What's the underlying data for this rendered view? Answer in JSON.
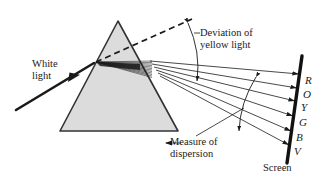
{
  "figure": {
    "name": "prism-dispersion-diagram",
    "type": "physics-optics-ray-diagram",
    "background_color": "#ffffff",
    "ink_color": "#1a1a1a",
    "prism_fill": "#dcdcdc"
  },
  "labels": {
    "white_light": "White\nlight",
    "deviation": "Deviation of\nyellow light",
    "dispersion": "Measure of\ndispersion",
    "screen": "Screen"
  },
  "spectrum": {
    "letters": [
      {
        "symbol": "R",
        "name": "red",
        "x": 305,
        "y": 74
      },
      {
        "symbol": "O",
        "name": "orange",
        "x": 303,
        "y": 88
      },
      {
        "symbol": "Y",
        "name": "yellow",
        "x": 301,
        "y": 101
      },
      {
        "symbol": "G",
        "name": "green",
        "x": 299,
        "y": 116
      },
      {
        "symbol": "B",
        "name": "blue",
        "x": 296,
        "y": 131
      },
      {
        "symbol": "V",
        "name": "violet",
        "x": 294,
        "y": 145
      }
    ]
  },
  "geometry": {
    "prism": {
      "apex": [
        118,
        21
      ],
      "base_left": [
        60,
        131
      ],
      "base_right": [
        178,
        131
      ]
    },
    "incident_ray": {
      "from": [
        16,
        110
      ],
      "to": [
        96,
        62
      ]
    },
    "entry_point": [
      96,
      62
    ],
    "undeviated_dashed": {
      "from": [
        96,
        62
      ],
      "to": [
        192,
        19
      ]
    },
    "screen_line": {
      "from": [
        302,
        56
      ],
      "to": [
        287,
        163
      ]
    },
    "deviation_arc": {
      "from": [
        188,
        23
      ],
      "to": [
        197,
        81
      ]
    },
    "dispersion_arc": {
      "from": [
        256,
        77
      ],
      "to": [
        239,
        131
      ]
    },
    "ray_count": 6
  }
}
